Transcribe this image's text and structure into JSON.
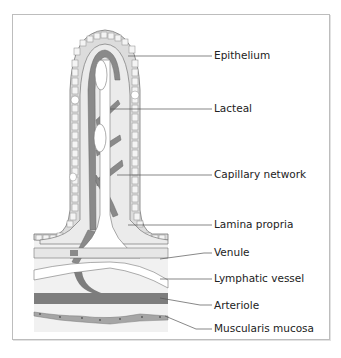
{
  "diagram": {
    "labels": [
      {
        "id": "epithelium",
        "text": "Epithelium",
        "y": 55
      },
      {
        "id": "lacteal",
        "text": "Lacteal",
        "y": 108
      },
      {
        "id": "capillary-network",
        "text": "Capillary network",
        "y": 174
      },
      {
        "id": "lamina-propria",
        "text": "Lamina propria",
        "y": 224
      },
      {
        "id": "venule",
        "text": "Venule",
        "y": 252
      },
      {
        "id": "lymphatic-vessel",
        "text": "Lymphatic vessel",
        "y": 278
      },
      {
        "id": "arteriole",
        "text": "Arteriole",
        "y": 305
      },
      {
        "id": "muscularis-mucosa",
        "text": "Muscularis mucosa",
        "y": 328
      }
    ],
    "colors": {
      "frame": "#bdbdbd",
      "epithelium_fill": "#dcdcdc",
      "lamina_fill": "#ebebeb",
      "capillary": "#8a8a8a",
      "arteriole": "#7d7d7d",
      "lacteal": "#ffffff",
      "outline": "#777777",
      "muscularis": "#a5a5a5"
    }
  }
}
